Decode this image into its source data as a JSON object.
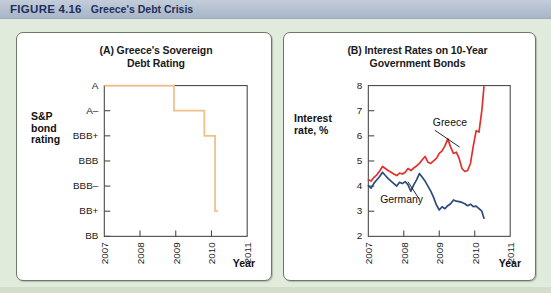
{
  "header": {
    "figure_word": "FIGURE",
    "figure_number": "4.16",
    "title": "Greece's Debt Crisis"
  },
  "panel_a": {
    "title_line1": "(A) Greece's Sovereign",
    "title_line2": "Debt Rating",
    "y_axis_label_line1": "S&P",
    "y_axis_label_line2": "bond",
    "y_axis_label_line3": "rating",
    "x_axis_label": "Year",
    "line_color": "#f0c08a"
  },
  "panel_b": {
    "title_line1": "(B) Interest Rates on 10-Year",
    "title_line2": "Government Bonds",
    "y_axis_label_line1": "Interest",
    "y_axis_label_line2": "rate, %",
    "x_axis_label": "Year",
    "greece_label": "Greece",
    "germany_label": "Germany",
    "greece_color": "#e0302c",
    "germany_color": "#2c4a7c"
  },
  "chart_data": [
    {
      "type": "line",
      "panel": "A",
      "title": "(A) Greece's Sovereign Debt Rating",
      "xlabel": "Year",
      "ylabel": "S&P bond rating",
      "step": true,
      "xlim": [
        2007,
        2011
      ],
      "x_ticks": [
        "2007",
        "2008",
        "2009",
        "2010",
        "2011"
      ],
      "x_tick_values": [
        2007,
        2008,
        2009,
        2010,
        2011
      ],
      "y_categories": [
        "A",
        "A–",
        "BBB+",
        "BBB",
        "BBB–",
        "BB+",
        "BB"
      ],
      "series": [
        {
          "name": "S&P rating of Greek sovereign debt",
          "color": "#f0c08a",
          "points": [
            {
              "x": 2007.0,
              "rating": "A"
            },
            {
              "x": 2008.95,
              "rating": "A"
            },
            {
              "x": 2008.95,
              "rating": "A–"
            },
            {
              "x": 2009.8,
              "rating": "A–"
            },
            {
              "x": 2009.8,
              "rating": "BBB+"
            },
            {
              "x": 2010.1,
              "rating": "BBB+"
            },
            {
              "x": 2010.1,
              "rating": "BB+"
            },
            {
              "x": 2010.18,
              "rating": "BB+"
            }
          ]
        }
      ]
    },
    {
      "type": "line",
      "panel": "B",
      "title": "(B) Interest Rates on 10-Year Government Bonds",
      "xlabel": "Year",
      "ylabel": "Interest rate, %",
      "xlim": [
        2007,
        2011
      ],
      "ylim": [
        2,
        8
      ],
      "y_ticks": [
        2,
        3,
        4,
        5,
        6,
        7,
        8
      ],
      "x_ticks": [
        "2007",
        "2008",
        "2009",
        "2010",
        "2011"
      ],
      "x_tick_values": [
        2007,
        2008,
        2009,
        2010,
        2011
      ],
      "grid": false,
      "legend": "inline annotations",
      "series": [
        {
          "name": "Greece",
          "color": "#e0302c",
          "x": [
            2007.0,
            2007.08,
            2007.16,
            2007.24,
            2007.32,
            2007.4,
            2007.48,
            2007.56,
            2007.64,
            2007.72,
            2007.8,
            2007.88,
            2007.96,
            2008.04,
            2008.12,
            2008.2,
            2008.28,
            2008.36,
            2008.44,
            2008.52,
            2008.6,
            2008.68,
            2008.76,
            2008.84,
            2008.92,
            2009.0,
            2009.08,
            2009.16,
            2009.24,
            2009.32,
            2009.4,
            2009.48,
            2009.56,
            2009.64,
            2009.72,
            2009.8,
            2009.88,
            2009.96,
            2010.04,
            2010.12,
            2010.2,
            2010.26
          ],
          "values": [
            4.25,
            4.2,
            4.35,
            4.45,
            4.6,
            4.78,
            4.7,
            4.62,
            4.55,
            4.48,
            4.42,
            4.52,
            4.48,
            4.55,
            4.7,
            4.62,
            4.72,
            4.8,
            4.9,
            5.05,
            5.18,
            4.95,
            4.9,
            5.0,
            5.1,
            5.3,
            5.4,
            5.6,
            5.88,
            5.55,
            5.3,
            5.35,
            5.1,
            4.7,
            4.58,
            4.62,
            4.9,
            5.6,
            6.2,
            6.15,
            7.0,
            7.95
          ]
        },
        {
          "name": "Germany",
          "color": "#2c4a7c",
          "x": [
            2007.0,
            2007.08,
            2007.16,
            2007.24,
            2007.32,
            2007.4,
            2007.48,
            2007.56,
            2007.64,
            2007.72,
            2007.8,
            2007.88,
            2007.96,
            2008.04,
            2008.12,
            2008.2,
            2008.28,
            2008.36,
            2008.44,
            2008.52,
            2008.6,
            2008.68,
            2008.76,
            2008.84,
            2008.92,
            2009.0,
            2009.08,
            2009.16,
            2009.24,
            2009.32,
            2009.4,
            2009.48,
            2009.56,
            2009.64,
            2009.72,
            2009.8,
            2009.88,
            2009.96,
            2010.04,
            2010.12,
            2010.2,
            2010.26
          ],
          "values": [
            4.02,
            3.92,
            4.12,
            4.25,
            4.38,
            4.55,
            4.42,
            4.3,
            4.2,
            4.1,
            4.0,
            4.15,
            4.1,
            4.18,
            4.05,
            3.8,
            4.05,
            4.25,
            4.5,
            4.35,
            4.2,
            4.0,
            3.8,
            3.55,
            3.25,
            3.05,
            3.18,
            3.1,
            3.22,
            3.3,
            3.45,
            3.4,
            3.38,
            3.35,
            3.3,
            3.22,
            3.28,
            3.18,
            3.2,
            3.1,
            3.0,
            2.72
          ]
        }
      ]
    }
  ]
}
